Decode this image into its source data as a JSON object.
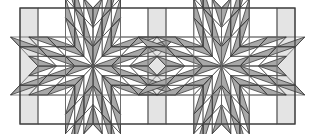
{
  "diagram": {
    "type": "quilt-block-layout",
    "frame": {
      "x": 20,
      "y": 8,
      "width": 275,
      "height": 116
    },
    "sashing": [
      {
        "x": 20,
        "width": 18
      },
      {
        "x": 148,
        "width": 18
      },
      {
        "x": 277,
        "width": 18
      }
    ],
    "blocks": [
      {
        "x": 38,
        "width": 110
      },
      {
        "x": 166,
        "width": 111
      }
    ],
    "grid_divisions": 4,
    "colors": {
      "background": "#ffffff",
      "sashing": "#e4e4e4",
      "triangle_fill": "#a8a8a8",
      "line": "#3a3a3a",
      "grid_line": "#6a6a6a"
    }
  }
}
